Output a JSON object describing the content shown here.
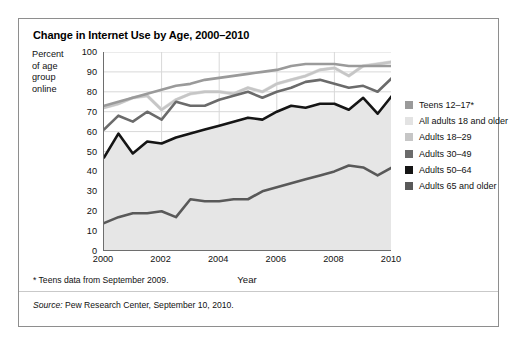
{
  "figure": {
    "title": "Change in Internet Use by Age, 2000–2010",
    "y_axis_label_lines": [
      "Percent",
      "of age",
      "group",
      "online"
    ],
    "footnote": "* Teens data from September 2009.",
    "source_prefix": "Source:",
    "source_text": " Pew Research Center, September 10, 2010."
  },
  "legend": {
    "items": [
      {
        "label": "Teens 12–17*",
        "color": "#9a9a9a"
      },
      {
        "label": "All adults 18 and older",
        "color": "#e3e3e3"
      },
      {
        "label": "Adults 18–29",
        "color": "#c6c6c6"
      },
      {
        "label": "Adults 30–49",
        "color": "#6b6b6b"
      },
      {
        "label": "Adults 50–64",
        "color": "#151515"
      },
      {
        "label": "Adults 65 and older",
        "color": "#595959"
      }
    ]
  },
  "chart_data": {
    "type": "line",
    "title": "Change in Internet Use by Age, 2000–2010",
    "xlabel": "Year",
    "ylabel": "Percent of age group online",
    "xlim": [
      2000,
      2010
    ],
    "ylim": [
      0,
      100
    ],
    "xticks": [
      2000,
      2002,
      2004,
      2006,
      2008,
      2010
    ],
    "yticks": [
      0,
      10,
      20,
      30,
      40,
      50,
      60,
      70,
      80,
      90,
      100
    ],
    "grid": true,
    "legend_position": "right",
    "x": [
      2000,
      2000.5,
      2001,
      2001.5,
      2002,
      2002.5,
      2003,
      2003.5,
      2004,
      2004.5,
      2005,
      2005.5,
      2006,
      2006.5,
      2007,
      2007.5,
      2008,
      2008.5,
      2009,
      2009.5,
      2010
    ],
    "series": [
      {
        "name": "Teens 12–17*",
        "color": "#9a9a9a",
        "values": [
          73,
          75,
          77,
          79,
          81,
          83,
          84,
          86,
          87,
          88,
          89,
          90,
          91,
          93,
          94,
          94,
          94,
          93,
          93,
          93,
          93
        ]
      },
      {
        "name": "All adults 18 and older",
        "color": "#e3e3e3",
        "values": [
          72,
          74,
          77,
          78,
          71,
          76,
          79,
          80,
          80,
          79,
          82,
          80,
          84,
          86,
          88,
          91,
          92,
          88,
          93,
          94,
          95
        ]
      },
      {
        "name": "Adults 18–29",
        "color": "#c6c6c6",
        "values": [
          72,
          74,
          77,
          78,
          71,
          76,
          79,
          80,
          80,
          79,
          82,
          80,
          84,
          86,
          88,
          91,
          92,
          88,
          93,
          94,
          95
        ]
      },
      {
        "name": "Adults 30–49",
        "color": "#6b6b6b",
        "values": [
          61,
          68,
          65,
          70,
          66,
          75,
          73,
          73,
          76,
          78,
          80,
          77,
          80,
          82,
          85,
          86,
          84,
          82,
          83,
          80,
          87
        ]
      },
      {
        "name": "Adults 50–64",
        "color": "#151515",
        "values": [
          47,
          59,
          49,
          55,
          54,
          57,
          59,
          61,
          63,
          65,
          67,
          66,
          70,
          73,
          72,
          74,
          74,
          71,
          77,
          69,
          78
        ]
      },
      {
        "name": "Adults 65 and older",
        "color": "#595959",
        "values": [
          14,
          17,
          19,
          19,
          20,
          17,
          26,
          25,
          25,
          26,
          26,
          30,
          32,
          34,
          36,
          38,
          40,
          43,
          42,
          38,
          42
        ]
      }
    ]
  }
}
